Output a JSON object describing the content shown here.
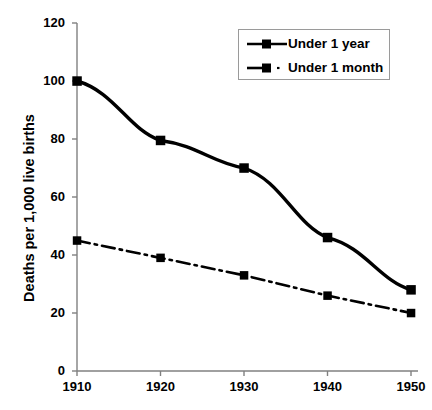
{
  "chart_data": {
    "type": "line",
    "title": "",
    "subtitle": "",
    "xlabel": "",
    "ylabel": "Deaths per 1,000 live births",
    "x": [
      1910,
      1920,
      1930,
      1940,
      1950
    ],
    "categories": [
      "1910",
      "1920",
      "1930",
      "1940",
      "1950"
    ],
    "xlim": [
      1910,
      1950
    ],
    "ylim": [
      0,
      120
    ],
    "y_ticks": [
      0,
      20,
      40,
      60,
      80,
      100,
      120
    ],
    "y_tick_labels": [
      "0",
      "20",
      "40",
      "60",
      "80",
      "100",
      "120"
    ],
    "x_ticks": [
      1910,
      1920,
      1930,
      1940,
      1950
    ],
    "x_tick_labels": [
      "1910",
      "1920",
      "1930",
      "1940",
      "1950"
    ],
    "grid": false,
    "legend_position": "top-right",
    "series": [
      {
        "name": "Under 1 year",
        "values": [
          100,
          79.5,
          70,
          46,
          28
        ],
        "line_style": "solid",
        "marker": "square",
        "color": "#000000"
      },
      {
        "name": "Under 1 month",
        "values": [
          45,
          39,
          33,
          26,
          20
        ],
        "line_style": "dash-dot",
        "marker": "square",
        "color": "#000000"
      }
    ]
  },
  "legend": {
    "entries": [
      {
        "label": "Under 1 year"
      },
      {
        "label": "Under 1 month"
      }
    ]
  },
  "colors": {
    "series": "#000000",
    "axis": "#808080",
    "legend_border": "#9a9a9a",
    "background": "#ffffff"
  }
}
